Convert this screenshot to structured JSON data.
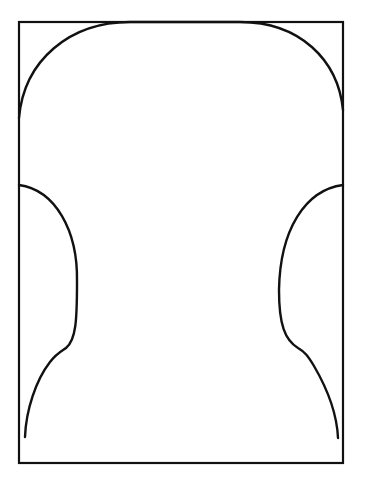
{
  "diagram": {
    "stroke_color": "#111111",
    "background_color": "#ffffff",
    "frame": {
      "x": 19,
      "y": 22,
      "width": 324,
      "height": 441
    },
    "shapes": {
      "top_arc": "M19,118 C24,60 70,22 130,22 L240,22 C300,22 338,60 343,110",
      "left_lobe": "M19,185 C55,190 78,230 77,282 C77,320 76,340 66,348 C60,352 56,354 50,362 C36,380 26,410 25,437",
      "right_lobe": "M343,185 C305,190 280,230 279,290 C279,325 285,340 298,348 C305,352 308,356 314,366 C328,390 337,415 338,438"
    }
  }
}
